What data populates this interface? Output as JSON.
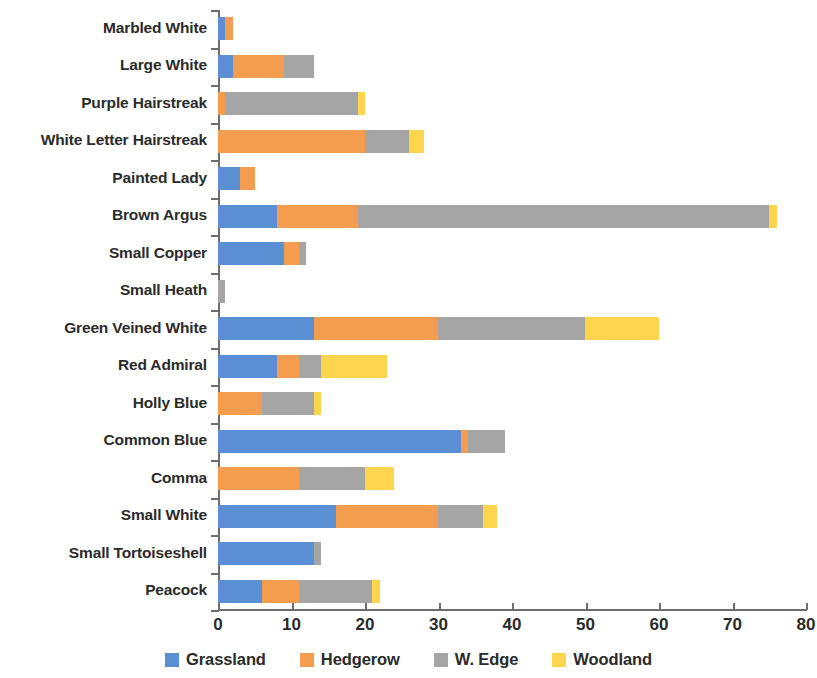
{
  "chart_data": {
    "type": "bar",
    "orientation": "horizontal",
    "stacked": true,
    "title": "",
    "xlabel": "",
    "ylabel": "",
    "xlim": [
      0,
      80
    ],
    "xticks": [
      0,
      10,
      20,
      30,
      40,
      50,
      60,
      70,
      80
    ],
    "grid": false,
    "legend_position": "bottom",
    "categories": [
      "Marbled White",
      "Large White",
      "Purple Hairstreak",
      "White Letter Hairstreak",
      "Painted Lady",
      "Brown Argus",
      "Small Copper",
      "Small Heath",
      "Green Veined White",
      "Red Admiral",
      "Holly Blue",
      "Common Blue",
      "Comma",
      "Small White",
      "Small Tortoiseshell",
      "Peacock"
    ],
    "series": [
      {
        "name": "Grassland",
        "color": "#5b8fd4",
        "values": [
          1,
          2,
          0,
          0,
          3,
          8,
          9,
          0,
          13,
          8,
          0,
          33,
          0,
          16,
          13,
          6
        ]
      },
      {
        "name": "Hedgerow",
        "color": "#f59d4e",
        "values": [
          1,
          7,
          1,
          20,
          2,
          11,
          2,
          0,
          17,
          3,
          6,
          1,
          11,
          14,
          0,
          5
        ]
      },
      {
        "name": "W. Edge",
        "color": "#a5a5a5",
        "values": [
          0,
          4,
          18,
          6,
          0,
          56,
          1,
          1,
          20,
          3,
          7,
          5,
          9,
          6,
          1,
          10
        ]
      },
      {
        "name": "Woodland",
        "color": "#ffd44f",
        "values": [
          0,
          0,
          1,
          2,
          0,
          1,
          0,
          0,
          10,
          9,
          1,
          0,
          4,
          2,
          0,
          1
        ]
      }
    ],
    "totals": [
      2,
      13,
      20,
      28,
      5,
      76,
      12,
      1,
      60,
      23,
      14,
      39,
      24,
      38,
      14,
      22
    ]
  },
  "legend": {
    "items": [
      {
        "label": "Grassland",
        "color": "#5b8fd4",
        "swatch": "grassland-swatch"
      },
      {
        "label": "Hedgerow",
        "color": "#f59d4e",
        "swatch": "hedgerow-swatch"
      },
      {
        "label": "W. Edge",
        "color": "#a5a5a5",
        "swatch": "wedge-swatch"
      },
      {
        "label": "Woodland",
        "color": "#ffd44f",
        "swatch": "woodland-swatch"
      }
    ]
  }
}
